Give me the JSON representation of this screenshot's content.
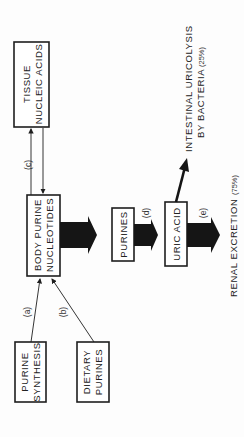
{
  "diagram": {
    "orientation": "rotated-90-ccw",
    "nodes": {
      "tissue": {
        "line1": "TISSUE",
        "line2": "NUCLEIC ACIDS"
      },
      "body": {
        "line1": "BODY PURINE",
        "line2": "NUCLEOTIDES"
      },
      "synthesis": {
        "line1": "PURINE",
        "line2": "SYNTHESIS"
      },
      "dietary": {
        "line1": "DIETARY",
        "line2": "PURINES"
      },
      "purines": {
        "line1": "PURINES"
      },
      "uric": {
        "line1": "URIC ACID"
      }
    },
    "edge_labels": {
      "a": "(a)",
      "b": "(b)",
      "c": "(c)",
      "d": "(d)",
      "e": "(e)"
    },
    "outputs": {
      "intestinal": {
        "line1": "INTESTINAL URICOLYSIS",
        "line2": "BY BACTERIA",
        "pct": "(25%)"
      },
      "renal": {
        "line1": "RENAL EXCRETION",
        "pct": "(75%)"
      }
    },
    "colors": {
      "ink": "#1e1e1e",
      "background": "#fdfdfd"
    }
  }
}
